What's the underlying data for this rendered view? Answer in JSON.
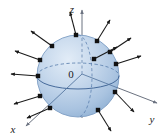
{
  "figure": {
    "kind": "sphere-with-outward-normal-vectors",
    "background_color": "#ffffff",
    "width": 166,
    "height": 138
  },
  "axes": {
    "origin_label": "0",
    "origin_point": {
      "x": 82,
      "y": 74
    },
    "color": "#6b7280",
    "items": [
      {
        "name": "z",
        "label": "z",
        "label_pos": {
          "x": 72,
          "y": 13
        },
        "line": {
          "x1": 82,
          "y1": 118,
          "x2": 82,
          "y2": 10
        },
        "arrow_at": {
          "x": 82,
          "y": 7
        }
      },
      {
        "name": "y",
        "label": "y",
        "label_pos": {
          "x": 152,
          "y": 123
        },
        "line": {
          "x1": 82,
          "y1": 74,
          "x2": 157,
          "y2": 103
        },
        "arrow_at": {
          "x": 159,
          "y": 104
        }
      },
      {
        "name": "x",
        "label": "x",
        "label_pos": {
          "x": 13,
          "y": 133
        },
        "line": {
          "x1": 82,
          "y1": 74,
          "x2": 26,
          "y2": 126
        },
        "arrow_at": {
          "x": 24,
          "y": 128
        }
      }
    ]
  },
  "sphere": {
    "center": {
      "x": 78,
      "y": 76
    },
    "radius": 41,
    "fill_light": "#d8e3f1",
    "fill_mid": "#b6cce4",
    "fill_dark": "#93b2d4",
    "outline_color": "#7e9ec4",
    "equator": {
      "rx": 41,
      "ry": 13,
      "front_style": "solid",
      "back_style": "dashed"
    },
    "meridian": {
      "rx": 14,
      "ry": 41,
      "style": "dashed"
    }
  },
  "normal_vectors": {
    "color": "#1a1a1a",
    "base_marker": "square",
    "count": 12,
    "items": [
      {
        "id": "n1",
        "base": {
          "x": 76,
          "y": 35
        },
        "tip": {
          "x": 70,
          "y": 12
        }
      },
      {
        "id": "n2",
        "base": {
          "x": 97,
          "y": 41
        },
        "tip": {
          "x": 110,
          "y": 20
        }
      },
      {
        "id": "n3",
        "base": {
          "x": 110,
          "y": 52
        },
        "tip": {
          "x": 131,
          "y": 38
        }
      },
      {
        "id": "n4",
        "base": {
          "x": 116,
          "y": 64
        },
        "tip": {
          "x": 141,
          "y": 56
        }
      },
      {
        "id": "n5",
        "base": {
          "x": 115,
          "y": 92
        },
        "tip": {
          "x": 134,
          "y": 112
        }
      },
      {
        "id": "n6",
        "base": {
          "x": 98,
          "y": 110
        },
        "tip": {
          "x": 111,
          "y": 131
        }
      },
      {
        "id": "n7",
        "base": {
          "x": 50,
          "y": 108
        },
        "tip": {
          "x": 27,
          "y": 118
        }
      },
      {
        "id": "n8",
        "base": {
          "x": 40,
          "y": 96
        },
        "tip": {
          "x": 14,
          "y": 104
        }
      },
      {
        "id": "n9",
        "base": {
          "x": 38,
          "y": 76
        },
        "tip": {
          "x": 11,
          "y": 74
        }
      },
      {
        "id": "n10",
        "base": {
          "x": 40,
          "y": 60
        },
        "tip": {
          "x": 15,
          "y": 51
        }
      },
      {
        "id": "n11",
        "base": {
          "x": 52,
          "y": 46
        },
        "tip": {
          "x": 31,
          "y": 31
        }
      },
      {
        "id": "n12",
        "base": {
          "x": 94,
          "y": 59
        },
        "tip": {
          "x": 117,
          "y": 47
        }
      }
    ]
  }
}
